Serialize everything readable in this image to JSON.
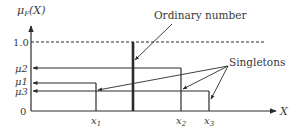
{
  "diagram": {
    "y_axis_label": "μF(X)",
    "y_axis_label_main": "μ",
    "y_axis_label_sub": "F",
    "y_axis_label_arg": "(X)",
    "x_axis_label": "X",
    "y_ticks": {
      "one": "1.0",
      "mu2": "μ2",
      "mu1": "μ1",
      "mu3": "μ3",
      "zero": "0"
    },
    "x_ticks": {
      "x1": "x",
      "x1_sub": "1",
      "x2": "x",
      "x2_sub": "2",
      "x3": "x",
      "x3_sub": "3"
    },
    "annotations": {
      "ordinary_number": "Ordinary number",
      "singletons": "Singletons"
    },
    "colors": {
      "line": "#2b2b2b",
      "text": "#3a3a3a",
      "background": "#ffffff"
    }
  }
}
